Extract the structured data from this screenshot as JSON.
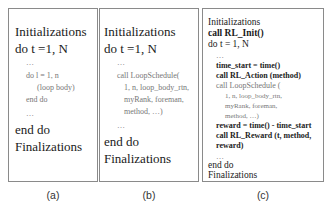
{
  "panels": [
    {
      "caption": "(a)",
      "lines": [
        "Initializations",
        "do t =1, N",
        "…",
        "do l = 1, n",
        "(loop body)",
        "end do",
        "…",
        "end do",
        "Finalizations"
      ]
    },
    {
      "caption": "(b)",
      "lines": [
        "Initializations",
        "do t =1, N",
        "…",
        "call LoopSchedule(",
        "1, n, loop_body_rtn,",
        "myRank, foreman,",
        "method, …)",
        "…",
        "end do",
        "Finalizations"
      ]
    },
    {
      "caption": "(c)",
      "lines": [
        "Initializations",
        "call RL_Init()",
        "do t = 1, N",
        "…",
        "time_start = time()",
        "call RL_Action (method)",
        "call LoopSchedule (",
        "1, n, loop_body_rtn,",
        "myRank, foreman,",
        "method, …)",
        "reward = time() - time_start",
        "call RL_Reward (t, method,",
        "reward)",
        "…",
        "end do",
        "Finalizations"
      ]
    }
  ]
}
